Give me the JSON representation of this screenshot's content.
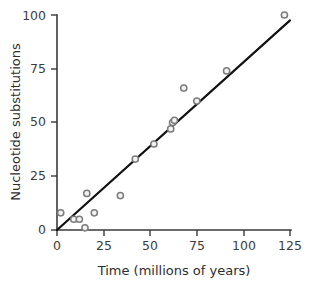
{
  "chart_data": {
    "type": "scatter",
    "title": "",
    "xlabel": "Time (millions of years)",
    "ylabel": "Nucleotide substitutions",
    "xlim": [
      0,
      125
    ],
    "ylim": [
      0,
      100
    ],
    "xticks": [
      0,
      25,
      50,
      75,
      100,
      125
    ],
    "yticks": [
      0,
      25,
      50,
      75,
      100
    ],
    "xtick_labels": [
      "0",
      "25",
      "50",
      "75",
      "100",
      "125"
    ],
    "ytick_labels": [
      "0",
      "25",
      "50",
      "75",
      "100"
    ],
    "grid": false,
    "legend": false,
    "marker_style": "open-circle-gray",
    "points": [
      {
        "x": 2,
        "y": 8
      },
      {
        "x": 9,
        "y": 5
      },
      {
        "x": 12,
        "y": 5
      },
      {
        "x": 15,
        "y": 1
      },
      {
        "x": 16,
        "y": 17
      },
      {
        "x": 20,
        "y": 8
      },
      {
        "x": 34,
        "y": 16
      },
      {
        "x": 42,
        "y": 33
      },
      {
        "x": 52,
        "y": 40
      },
      {
        "x": 61,
        "y": 47
      },
      {
        "x": 62,
        "y": 50
      },
      {
        "x": 63,
        "y": 51
      },
      {
        "x": 68,
        "y": 66
      },
      {
        "x": 75,
        "y": 60
      },
      {
        "x": 91,
        "y": 74
      },
      {
        "x": 122,
        "y": 100
      }
    ],
    "trendline": {
      "type": "linear",
      "intercept": 0,
      "slope": 0.78,
      "x_start": 0,
      "y_start": 0,
      "x_end": 125,
      "y_end": 97.5
    },
    "colors": {
      "marker_fill": "#f2f2f2",
      "marker_stroke": "#7b7b7b",
      "trendline": "#111111",
      "axis": "#3a3a3a",
      "text": "#3d3d3d",
      "background": "#ffffff"
    }
  }
}
